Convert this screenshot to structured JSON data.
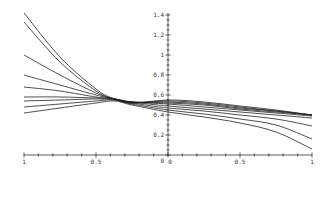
{
  "chart_data": {
    "type": "line",
    "title": "",
    "xlabel": "",
    "ylabel": "",
    "xlim": [
      -1,
      1
    ],
    "ylim": [
      0,
      1.4
    ],
    "grid": false,
    "legend": null,
    "x_ticks": [
      "-1",
      "-0.5",
      "0",
      "0.5",
      "1"
    ],
    "x_tick_labels_shown": [
      "1",
      "0.5",
      "0",
      "0.5",
      "1"
    ],
    "y_ticks": [
      "0.2",
      "0.4",
      "0.6",
      "0.8",
      "1",
      "1.2",
      "1.4"
    ],
    "y_tick_labels_shown": [
      "0.2",
      "0.4",
      "0.6",
      "0.8",
      "1",
      "1.2",
      "1.4"
    ],
    "x": [
      -1,
      -0.75,
      -0.5,
      -0.37,
      -0.25,
      0,
      0.25,
      0.5,
      0.75,
      1
    ],
    "series": [
      {
        "name": "curve-1",
        "values": [
          1.42,
          0.98,
          0.66,
          0.56,
          0.52,
          0.55,
          0.53,
          0.49,
          0.45,
          0.4
        ]
      },
      {
        "name": "curve-2",
        "values": [
          1.33,
          0.93,
          0.64,
          0.56,
          0.52,
          0.54,
          0.52,
          0.48,
          0.44,
          0.4
        ]
      },
      {
        "name": "curve-3",
        "values": [
          1.0,
          0.8,
          0.62,
          0.56,
          0.53,
          0.53,
          0.51,
          0.47,
          0.44,
          0.4
        ]
      },
      {
        "name": "curve-4",
        "values": [
          0.8,
          0.7,
          0.6,
          0.56,
          0.53,
          0.52,
          0.5,
          0.46,
          0.43,
          0.4
        ]
      },
      {
        "name": "curve-5",
        "values": [
          0.68,
          0.64,
          0.58,
          0.56,
          0.53,
          0.51,
          0.48,
          0.45,
          0.42,
          0.39
        ]
      },
      {
        "name": "curve-6",
        "values": [
          0.58,
          0.58,
          0.57,
          0.56,
          0.53,
          0.49,
          0.46,
          0.43,
          0.4,
          0.37
        ]
      },
      {
        "name": "curve-7",
        "values": [
          0.54,
          0.55,
          0.56,
          0.55,
          0.52,
          0.47,
          0.44,
          0.4,
          0.36,
          0.29
        ]
      },
      {
        "name": "curve-8",
        "values": [
          0.48,
          0.51,
          0.54,
          0.55,
          0.51,
          0.45,
          0.41,
          0.36,
          0.3,
          0.16
        ]
      },
      {
        "name": "curve-9",
        "values": [
          0.42,
          0.47,
          0.52,
          0.54,
          0.5,
          0.43,
          0.38,
          0.32,
          0.23,
          0.06
        ]
      }
    ]
  }
}
